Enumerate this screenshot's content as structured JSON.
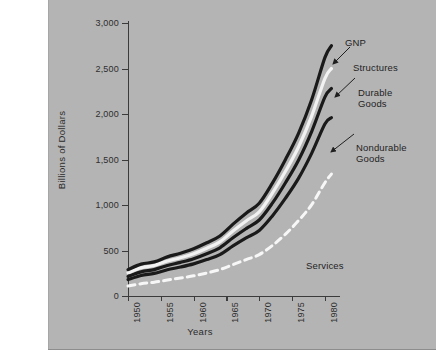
{
  "caption": {
    "lines": [
      "2.",
      "ne",
      "of",
      "n."
    ]
  },
  "chart_data": {
    "type": "line",
    "title": "",
    "xlabel": "Years",
    "ylabel": "Billions of Dollars",
    "xlim": [
      1950,
      1982
    ],
    "ylim": [
      0,
      3000
    ],
    "grid": false,
    "legend_position": "inline-annotations",
    "x_ticks": [
      "1950",
      "1955",
      "1960",
      "1965",
      "1970",
      "1975",
      "1980"
    ],
    "x_tick_values": [
      1950,
      1955,
      1960,
      1965,
      1970,
      1975,
      1980
    ],
    "y_ticks": [
      "0",
      "500",
      "1,000",
      "1,500",
      "2,000",
      "2,500",
      "3,000"
    ],
    "y_tick_values": [
      0,
      500,
      1000,
      1500,
      2000,
      2500,
      3000
    ],
    "x": [
      1950,
      1952,
      1954,
      1956,
      1958,
      1960,
      1962,
      1964,
      1966,
      1968,
      1970,
      1972,
      1974,
      1976,
      1978,
      1980,
      1981
    ],
    "series": [
      {
        "name": "GNP",
        "style": "solid-black",
        "color": "#1a1a1a",
        "values": [
          290,
          350,
          375,
          430,
          470,
          520,
          585,
          660,
          790,
          910,
          1020,
          1240,
          1500,
          1790,
          2160,
          2620,
          2750
        ]
      },
      {
        "name": "Structures",
        "style": "solid-white",
        "color": "#f2f2f2",
        "values": [
          255,
          310,
          335,
          385,
          420,
          465,
          525,
          595,
          715,
          825,
          925,
          1130,
          1370,
          1640,
          1980,
          2390,
          2500
        ]
      },
      {
        "name": "Durable Goods",
        "style": "solid-black",
        "color": "#1a1a1a",
        "values": [
          215,
          265,
          290,
          335,
          370,
          410,
          465,
          530,
          640,
          740,
          835,
          1020,
          1245,
          1495,
          1810,
          2185,
          2280
        ]
      },
      {
        "name": "Nondurable Goods",
        "style": "solid-black",
        "color": "#1a1a1a",
        "values": [
          180,
          225,
          248,
          288,
          318,
          353,
          400,
          455,
          550,
          638,
          720,
          880,
          1075,
          1295,
          1570,
          1890,
          1960
        ]
      },
      {
        "name": "Services",
        "style": "dashed-white",
        "color": "#f7f7f7",
        "values": [
          110,
          135,
          152,
          175,
          198,
          222,
          253,
          290,
          345,
          400,
          455,
          555,
          680,
          830,
          1005,
          1245,
          1340
        ]
      }
    ],
    "annotations": [
      {
        "label": "GNP",
        "x": 345,
        "y": 38,
        "arrow": false
      },
      {
        "label": "Structures",
        "x": 353,
        "y": 63,
        "arrow": true
      },
      {
        "label": "Durable\nGoods",
        "x": 358,
        "y": 88,
        "arrow": true
      },
      {
        "label": "Nondurable\nGoods",
        "x": 356,
        "y": 143,
        "arrow": true
      },
      {
        "label": "Services",
        "x": 306,
        "y": 260,
        "arrow": false
      }
    ]
  }
}
